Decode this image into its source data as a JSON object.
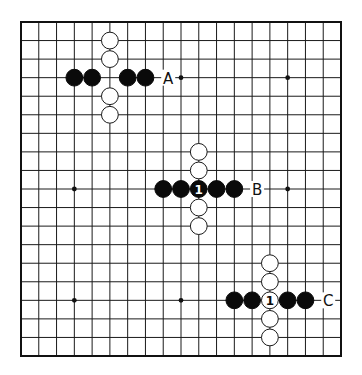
{
  "diagram": {
    "type": "go-board",
    "size": 19,
    "geometry": {
      "x0": 21,
      "y0": 22,
      "x1": 341,
      "y1": 356,
      "stone_radius": 8.4
    },
    "colors": {
      "line": "#1a1a1a",
      "black": "#0a0a0a",
      "white": "#ffffff",
      "background": "#ffffff"
    },
    "star_points": [
      [
        3,
        3
      ],
      [
        9,
        3
      ],
      [
        15,
        3
      ],
      [
        3,
        9
      ],
      [
        9,
        9
      ],
      [
        15,
        9
      ],
      [
        3,
        15
      ],
      [
        9,
        15
      ],
      [
        15,
        15
      ]
    ],
    "groups": [
      {
        "label": "A",
        "label_pos": [
          8,
          3
        ],
        "stones": [
          {
            "c": 5,
            "r": 1,
            "color": "white"
          },
          {
            "c": 5,
            "r": 2,
            "color": "white"
          },
          {
            "c": 5,
            "r": 4,
            "color": "white"
          },
          {
            "c": 5,
            "r": 5,
            "color": "white"
          },
          {
            "c": 3,
            "r": 3,
            "color": "black"
          },
          {
            "c": 4,
            "r": 3,
            "color": "black"
          },
          {
            "c": 6,
            "r": 3,
            "color": "black"
          },
          {
            "c": 7,
            "r": 3,
            "color": "black"
          }
        ]
      },
      {
        "label": "B",
        "label_pos": [
          13,
          9
        ],
        "stones": [
          {
            "c": 10,
            "r": 7,
            "color": "white"
          },
          {
            "c": 10,
            "r": 8,
            "color": "white"
          },
          {
            "c": 10,
            "r": 10,
            "color": "white"
          },
          {
            "c": 10,
            "r": 11,
            "color": "white"
          },
          {
            "c": 8,
            "r": 9,
            "color": "black"
          },
          {
            "c": 9,
            "r": 9,
            "color": "black"
          },
          {
            "c": 10,
            "r": 9,
            "color": "black",
            "number": "1"
          },
          {
            "c": 11,
            "r": 9,
            "color": "black"
          },
          {
            "c": 12,
            "r": 9,
            "color": "black"
          }
        ]
      },
      {
        "label": "C",
        "label_pos": [
          17,
          15
        ],
        "stones": [
          {
            "c": 14,
            "r": 13,
            "color": "white"
          },
          {
            "c": 14,
            "r": 14,
            "color": "white"
          },
          {
            "c": 14,
            "r": 15,
            "color": "white",
            "number": "1"
          },
          {
            "c": 14,
            "r": 16,
            "color": "white"
          },
          {
            "c": 14,
            "r": 17,
            "color": "white"
          },
          {
            "c": 12,
            "r": 15,
            "color": "black"
          },
          {
            "c": 13,
            "r": 15,
            "color": "black"
          },
          {
            "c": 15,
            "r": 15,
            "color": "black"
          },
          {
            "c": 16,
            "r": 15,
            "color": "black"
          }
        ]
      }
    ]
  }
}
